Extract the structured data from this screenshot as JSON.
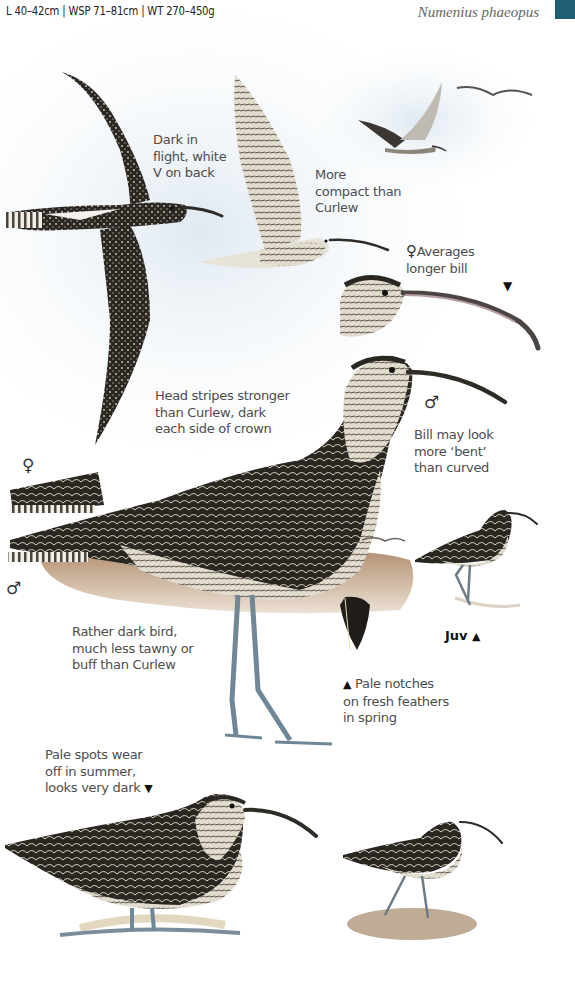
{
  "header": {
    "measurements": "L 40–42cm  |  WSP 71–81cm  |  WT 270–450g",
    "scientific_name": "Numenius phaeopus",
    "tab_color": "#1e5f74"
  },
  "annotations": {
    "flight_dark": [
      "Dark in",
      "flight, white",
      "V on back"
    ],
    "compact": [
      "More",
      "compact than",
      "Curlew"
    ],
    "female_bill": [
      "Averages",
      "longer bill"
    ],
    "head_stripes": [
      "Head stripes stronger",
      "than Curlew, dark",
      "each side of crown"
    ],
    "bill_bent": [
      "Bill may look",
      "more ‘bent’",
      "than curved"
    ],
    "dark_bird": [
      "Rather dark bird,",
      "much less tawny or",
      "buff than Curlew"
    ],
    "pale_notches": [
      "Pale notches",
      "on fresh feathers",
      "in spring"
    ],
    "pale_spots": [
      "Pale spots wear",
      "off in summer,",
      "looks very dark"
    ]
  },
  "symbols": {
    "female": "♀",
    "male": "♂",
    "triangle_up": "▲",
    "triangle_down": "▼"
  },
  "juv_label": "Juv",
  "colors": {
    "plumage_dark": "#2a2622",
    "plumage_mid": "#7b7266",
    "plumage_light": "#e6e0d4",
    "legs": "#6f8796",
    "ground": "#a67d5a",
    "sky_tint": "#e8f0f6"
  }
}
